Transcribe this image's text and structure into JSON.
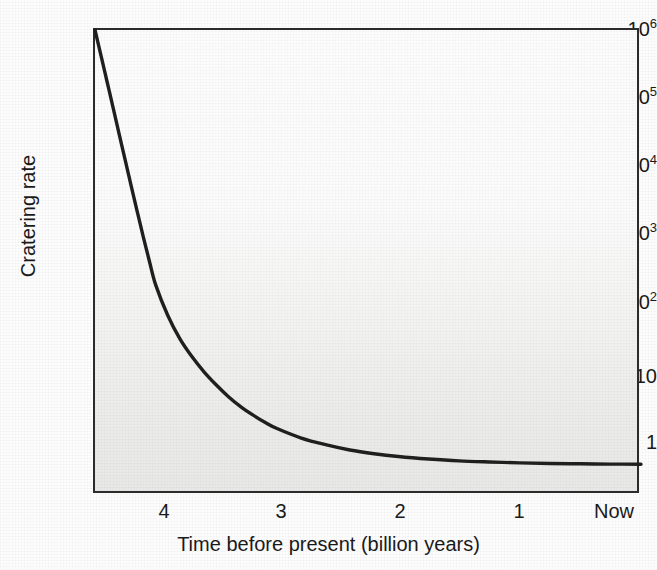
{
  "figure": {
    "background_color": "#fdfdfd",
    "plot_background_color": "#f4f4f3",
    "frame_color": "#2b2b2b",
    "curve_color": "#1f1f1f"
  },
  "chart_data": {
    "type": "line",
    "title": "",
    "xlabel": "Time before present (billion years)",
    "ylabel": "Cratering rate",
    "grid": false,
    "legend": null,
    "yscale": "log",
    "xlim": [
      4.5,
      0
    ],
    "ylim": [
      0.3,
      1000000
    ],
    "x_tick_values": [
      4,
      3,
      2,
      1,
      0
    ],
    "x_tick_labels": [
      "4",
      "3",
      "2",
      "1",
      "Now"
    ],
    "y_tick_values": [
      1000000,
      100000,
      10000,
      1000,
      100,
      10,
      1
    ],
    "y_tick_labels": [
      "10^6",
      "10^5",
      "10^4",
      "10^3",
      "10^2",
      "10",
      "1"
    ],
    "y_tick_mantissas": [
      "10",
      "10",
      "10",
      "10",
      "10",
      "10",
      "1"
    ],
    "y_tick_exponents": [
      "6",
      "5",
      "4",
      "3",
      "2",
      "",
      ""
    ],
    "series": [
      {
        "name": "Cratering rate",
        "x": [
          4.5,
          4.45,
          4.4,
          4.35,
          4.3,
          4.25,
          4.2,
          4.15,
          4.1,
          4.05,
          4.0,
          3.9,
          3.8,
          3.7,
          3.6,
          3.5,
          3.4,
          3.3,
          3.2,
          3.1,
          3.0,
          2.8,
          2.6,
          2.4,
          2.2,
          2.0,
          1.75,
          1.5,
          1.25,
          1.0,
          0.75,
          0.5,
          0.25,
          0.0
        ],
        "y": [
          1000000,
          420000,
          175000,
          73000,
          30000,
          12500,
          5200,
          2200,
          940,
          420,
          195,
          70,
          32,
          17.5,
          10.5,
          6.8,
          4.6,
          3.3,
          2.5,
          1.95,
          1.58,
          1.15,
          0.92,
          0.77,
          0.68,
          0.62,
          0.57,
          0.535,
          0.515,
          0.5,
          0.49,
          0.485,
          0.48,
          0.478
        ]
      }
    ]
  },
  "axes": {
    "x_title": "Time before present (billion years)",
    "y_title": "Cratering rate",
    "x_ticks": [
      {
        "label": "4",
        "value": 4
      },
      {
        "label": "3",
        "value": 3
      },
      {
        "label": "2",
        "value": 2
      },
      {
        "label": "1",
        "value": 1
      },
      {
        "label": "Now",
        "value": 0
      }
    ],
    "y_ticks": [
      {
        "mantissa": "10",
        "exponent": "6",
        "value": 1000000
      },
      {
        "mantissa": "10",
        "exponent": "5",
        "value": 100000
      },
      {
        "mantissa": "10",
        "exponent": "4",
        "value": 10000
      },
      {
        "mantissa": "10",
        "exponent": "3",
        "value": 1000
      },
      {
        "mantissa": "10",
        "exponent": "2",
        "value": 100
      },
      {
        "mantissa": "10",
        "exponent": "",
        "value": 10
      },
      {
        "mantissa": "1",
        "exponent": "",
        "value": 1
      }
    ]
  }
}
